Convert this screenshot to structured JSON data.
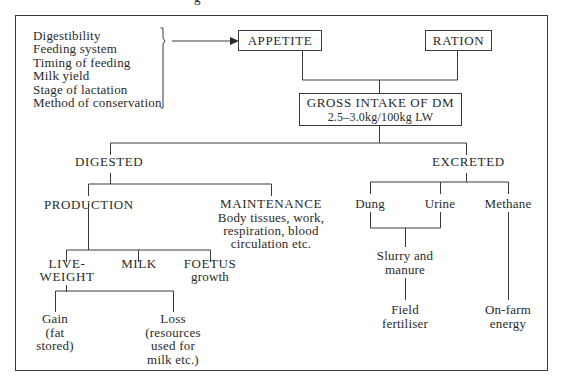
{
  "top_partial_text": "g",
  "factors": [
    "Digestibility",
    "Feeding system",
    "Timing of feeding",
    "Milk yield",
    "Stage of lactation",
    "Method of conservation"
  ],
  "nodes": {
    "appetite": "APPETITE",
    "ration": "RATION",
    "gross_intake": "GROSS INTAKE OF DM",
    "gross_intake_sub": "2.5–3.0kg/100kg LW",
    "digested": "DIGESTED",
    "excreted": "EXCRETED",
    "production": "PRODUCTION",
    "maintenance": "MAINTENANCE",
    "maintenance_desc": [
      "Body tissues, work,",
      "respiration, blood",
      "circulation etc."
    ],
    "liveweight": [
      "LIVE-",
      "WEIGHT"
    ],
    "milk": "MILK",
    "foetus": "FOETUS",
    "foetus_sub": "growth",
    "gain": [
      "Gain",
      "(fat",
      "stored)"
    ],
    "loss": [
      "Loss",
      "(resources",
      "used for",
      "milk etc.)"
    ],
    "dung": "Dung",
    "urine": "Urine",
    "methane": "Methane",
    "slurry": [
      "Slurry and",
      "manure"
    ],
    "field": [
      "Field",
      "fertiliser"
    ],
    "onfarm": [
      "On-farm",
      "energy"
    ]
  }
}
